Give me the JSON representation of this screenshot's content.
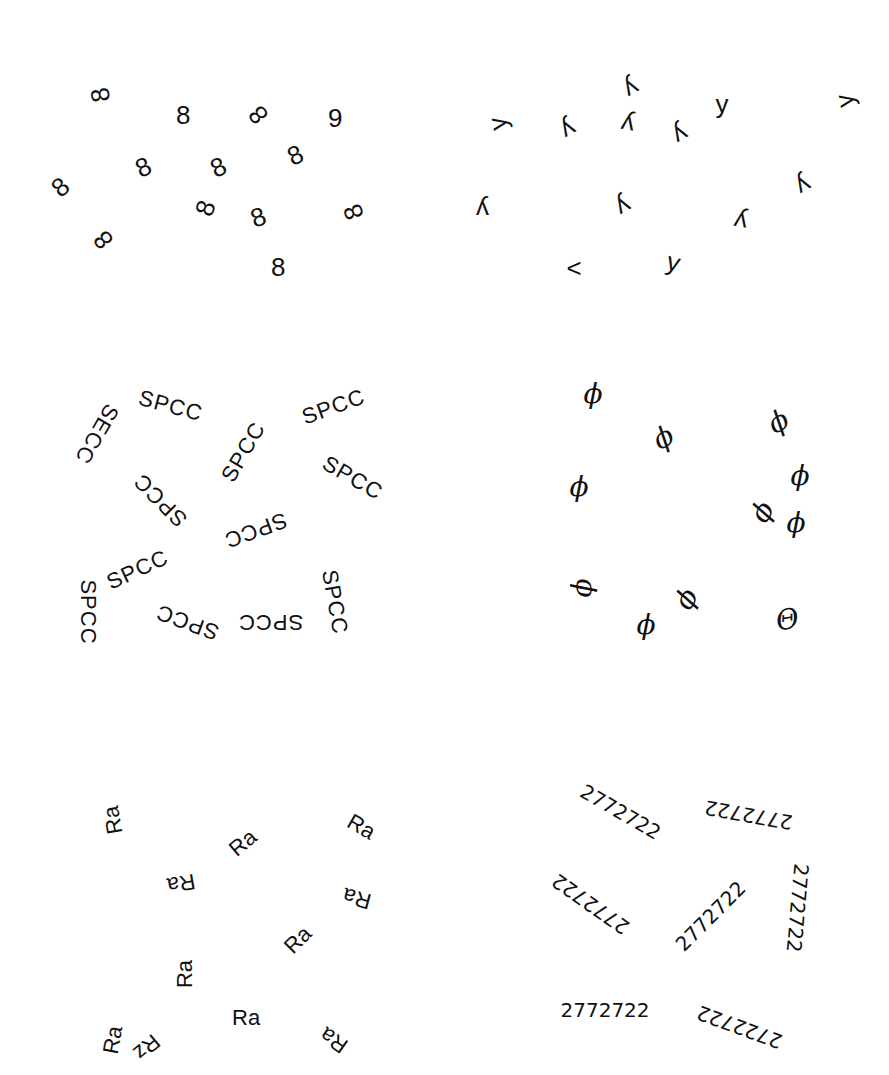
{
  "panels": [
    {
      "id": "eights",
      "target": "9",
      "items": [
        {
          "text": "8",
          "x": 100,
          "y": 95,
          "rot": -100
        },
        {
          "text": "8",
          "x": 183,
          "y": 115,
          "rot": 0
        },
        {
          "text": "8",
          "x": 258,
          "y": 115,
          "rot": -130
        },
        {
          "text": "9",
          "x": 335,
          "y": 118,
          "rot": 0
        },
        {
          "text": "8",
          "x": 60,
          "y": 187,
          "rot": -40
        },
        {
          "text": "8",
          "x": 143,
          "y": 167,
          "rot": -25
        },
        {
          "text": "8",
          "x": 218,
          "y": 167,
          "rot": -25
        },
        {
          "text": "8",
          "x": 295,
          "y": 155,
          "rot": -25
        },
        {
          "text": "8",
          "x": 205,
          "y": 208,
          "rot": -70
        },
        {
          "text": "8",
          "x": 258,
          "y": 217,
          "rot": -20
        },
        {
          "text": "8",
          "x": 353,
          "y": 212,
          "rot": -110
        },
        {
          "text": "8",
          "x": 103,
          "y": 240,
          "rot": -130
        },
        {
          "text": "8",
          "x": 278,
          "y": 267,
          "rot": 0
        }
      ]
    },
    {
      "id": "ys",
      "target": "<",
      "items": [
        {
          "text": "y",
          "x": 497,
          "y": 124,
          "rot": -100
        },
        {
          "text": "y",
          "x": 568,
          "y": 130,
          "rot": 150
        },
        {
          "text": "y",
          "x": 627,
          "y": 125,
          "rot": -170
        },
        {
          "text": "y",
          "x": 631,
          "y": 89,
          "rot": 150
        },
        {
          "text": "y",
          "x": 680,
          "y": 135,
          "rot": 150
        },
        {
          "text": "y",
          "x": 722,
          "y": 104,
          "rot": 0
        },
        {
          "text": "y",
          "x": 844,
          "y": 101,
          "rot": -100
        },
        {
          "text": "y",
          "x": 482,
          "y": 210,
          "rot": 180
        },
        {
          "text": "y",
          "x": 623,
          "y": 207,
          "rot": 150
        },
        {
          "text": "y",
          "x": 740,
          "y": 222,
          "rot": -170
        },
        {
          "text": "y",
          "x": 803,
          "y": 186,
          "rot": 150
        },
        {
          "text": "<",
          "x": 574,
          "y": 268,
          "rot": 0
        },
        {
          "text": "y",
          "x": 673,
          "y": 262,
          "rot": 15
        }
      ]
    },
    {
      "id": "spcc",
      "target": "SECC",
      "items": [
        {
          "text": "SPCC",
          "x": 170,
          "y": 406,
          "rot": 15
        },
        {
          "text": "SECC",
          "x": 96,
          "y": 434,
          "rot": 120
        },
        {
          "text": "SPCC",
          "x": 243,
          "y": 452,
          "rot": -60
        },
        {
          "text": "SPCC",
          "x": 333,
          "y": 407,
          "rot": -20
        },
        {
          "text": "SPCC",
          "x": 352,
          "y": 478,
          "rot": 30
        },
        {
          "text": "SPCC",
          "x": 160,
          "y": 500,
          "rot": -135
        },
        {
          "text": "SPCC",
          "x": 255,
          "y": 530,
          "rot": 160
        },
        {
          "text": "SPCC",
          "x": 137,
          "y": 570,
          "rot": -25
        },
        {
          "text": "SPCC",
          "x": 87,
          "y": 612,
          "rot": 90
        },
        {
          "text": "SPCC",
          "x": 187,
          "y": 622,
          "rot": -160
        },
        {
          "text": "SPCC",
          "x": 270,
          "y": 622,
          "rot": 180
        },
        {
          "text": "SPCC",
          "x": 334,
          "y": 602,
          "rot": 80
        }
      ]
    },
    {
      "id": "phi",
      "target": "Θ",
      "items": [
        {
          "text": "ϕ",
          "x": 593,
          "y": 394,
          "rot": 0
        },
        {
          "text": "ϕ",
          "x": 663,
          "y": 438,
          "rot": -30
        },
        {
          "text": "ϕ",
          "x": 579,
          "y": 487,
          "rot": 0
        },
        {
          "text": "ϕ",
          "x": 778,
          "y": 422,
          "rot": -30
        },
        {
          "text": "ϕ",
          "x": 800,
          "y": 476,
          "rot": 0
        },
        {
          "text": "ϕ",
          "x": 762,
          "y": 512,
          "rot": -60
        },
        {
          "text": "ϕ",
          "x": 796,
          "y": 523,
          "rot": 0
        },
        {
          "text": "ϕ",
          "x": 581,
          "y": 588,
          "rot": -90
        },
        {
          "text": "ϕ",
          "x": 686,
          "y": 599,
          "rot": -60
        },
        {
          "text": "ϕ",
          "x": 646,
          "y": 625,
          "rot": 0
        },
        {
          "text": "Θ",
          "x": 787,
          "y": 620,
          "rot": -10
        }
      ]
    },
    {
      "id": "ra",
      "target": "Rz",
      "items": [
        {
          "text": "Ra",
          "x": 113,
          "y": 820,
          "rot": -100
        },
        {
          "text": "Ra",
          "x": 243,
          "y": 843,
          "rot": -40
        },
        {
          "text": "Ra",
          "x": 361,
          "y": 827,
          "rot": 30
        },
        {
          "text": "Ra",
          "x": 181,
          "y": 883,
          "rot": 170
        },
        {
          "text": "Ra",
          "x": 357,
          "y": 898,
          "rot": -165
        },
        {
          "text": "Ra",
          "x": 298,
          "y": 940,
          "rot": -45
        },
        {
          "text": "Ra",
          "x": 185,
          "y": 974,
          "rot": -90
        },
        {
          "text": "Ra",
          "x": 246,
          "y": 1018,
          "rot": 0
        },
        {
          "text": "Ra",
          "x": 113,
          "y": 1040,
          "rot": -80
        },
        {
          "text": "Rz",
          "x": 146,
          "y": 1047,
          "rot": 140
        },
        {
          "text": "Ra",
          "x": 334,
          "y": 1040,
          "rot": -145
        }
      ]
    },
    {
      "id": "numbers",
      "target": "2722722",
      "items": [
        {
          "text": "2772722",
          "x": 620,
          "y": 812,
          "rot": 30
        },
        {
          "text": "2772722",
          "x": 748,
          "y": 815,
          "rot": 190
        },
        {
          "text": "2772722",
          "x": 590,
          "y": 904,
          "rot": 215
        },
        {
          "text": "2772722",
          "x": 710,
          "y": 916,
          "rot": -45
        },
        {
          "text": "2772722",
          "x": 797,
          "y": 908,
          "rot": 95
        },
        {
          "text": "2772722",
          "x": 605,
          "y": 1010,
          "rot": 0
        },
        {
          "text": "2722722",
          "x": 739,
          "y": 1027,
          "rot": 200
        }
      ]
    }
  ]
}
